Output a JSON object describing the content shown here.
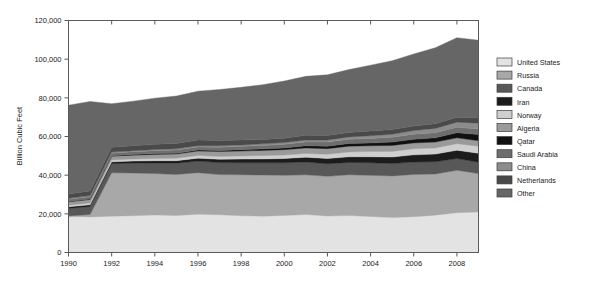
{
  "chart_data": {
    "type": "area",
    "title": "",
    "subtitle": "",
    "xlabel": "",
    "ylabel": "Billion Cubic Feet",
    "xlim": [
      1990,
      2009
    ],
    "ylim": [
      0,
      120000
    ],
    "ytick_step": 20000,
    "xtick_step": 2,
    "grid": false,
    "stacked": true,
    "legend_position": "right",
    "xticks": [
      1990,
      1992,
      1994,
      1996,
      1998,
      2000,
      2002,
      2004,
      2006,
      2008
    ],
    "xtick_labels": [
      "1990",
      "1992",
      "1994",
      "1996",
      "1998",
      "2000",
      "2002",
      "2004",
      "2006",
      "2008"
    ],
    "yticks": [
      0,
      20000,
      40000,
      60000,
      80000,
      100000,
      120000
    ],
    "ytick_labels": [
      "0",
      "20,000",
      "40,000",
      "60,000",
      "80,000",
      "100,000",
      "120,000"
    ],
    "x": [
      1990,
      1991,
      1992,
      1993,
      1994,
      1995,
      1996,
      1997,
      1998,
      1999,
      2000,
      2001,
      2002,
      2003,
      2004,
      2005,
      2006,
      2007,
      2008,
      2009
    ],
    "series": [
      {
        "name": "United States",
        "color": "#e3e3e3",
        "values": [
          18600,
          18400,
          18800,
          19000,
          19400,
          19100,
          19800,
          19500,
          19000,
          18800,
          19200,
          19600,
          18900,
          19100,
          18600,
          18100,
          18500,
          19300,
          20600,
          21000
        ]
      },
      {
        "name": "Russia",
        "color": "#a8a8a8",
        "values": [
          300,
          1200,
          22400,
          22100,
          21400,
          21300,
          21500,
          20800,
          21200,
          21300,
          20700,
          20600,
          20500,
          21100,
          21300,
          21500,
          21900,
          21300,
          21900,
          19800
        ]
      },
      {
        "name": "Canada",
        "color": "#585858",
        "values": [
          3900,
          4200,
          4700,
          5100,
          5500,
          5800,
          6000,
          6200,
          6200,
          6300,
          6500,
          6600,
          6500,
          6400,
          6500,
          6400,
          6400,
          6300,
          6100,
          5900
        ]
      },
      {
        "name": "Iran",
        "color": "#1c1c1c",
        "values": [
          800,
          900,
          1000,
          1100,
          1200,
          1300,
          1500,
          1700,
          1900,
          2000,
          2200,
          2500,
          2700,
          2900,
          3100,
          3400,
          3700,
          4000,
          4300,
          4600
        ]
      },
      {
        "name": "Norway",
        "color": "#cfcfcf",
        "values": [
          900,
          950,
          1000,
          1050,
          1150,
          1250,
          1400,
          1500,
          1600,
          1700,
          1800,
          1900,
          2200,
          2500,
          2700,
          2900,
          3100,
          3200,
          3400,
          3600
        ]
      },
      {
        "name": "Algeria",
        "color": "#9a9a9a",
        "values": [
          1700,
          1800,
          1900,
          2000,
          2100,
          2200,
          2300,
          2500,
          2600,
          2700,
          2800,
          2900,
          2900,
          3000,
          3000,
          3100,
          3100,
          3000,
          3000,
          2900
        ]
      },
      {
        "name": "Qatar",
        "color": "#111111",
        "values": [
          200,
          250,
          300,
          350,
          400,
          450,
          500,
          600,
          700,
          800,
          900,
          1100,
          1300,
          1400,
          1500,
          1700,
          1900,
          2200,
          2700,
          3200
        ]
      },
      {
        "name": "Saudi Arabia",
        "color": "#6e6e6e",
        "values": [
          1100,
          1200,
          1300,
          1400,
          1500,
          1600,
          1600,
          1700,
          1700,
          1800,
          1900,
          2000,
          2100,
          2200,
          2300,
          2500,
          2600,
          2700,
          2800,
          2900
        ]
      },
      {
        "name": "China",
        "color": "#8c8c8c",
        "values": [
          500,
          520,
          540,
          560,
          580,
          620,
          660,
          700,
          750,
          800,
          900,
          1000,
          1100,
          1200,
          1400,
          1600,
          1900,
          2200,
          2600,
          3000
        ]
      },
      {
        "name": "Netherlands",
        "color": "#4a4a4a",
        "values": [
          2300,
          2400,
          2500,
          2600,
          2700,
          2800,
          2900,
          2700,
          2500,
          2300,
          2200,
          2400,
          2300,
          2300,
          2500,
          2400,
          2300,
          2400,
          2600,
          2700
        ]
      },
      {
        "name": "Other",
        "color": "#666666",
        "values": [
          45900,
          46300,
          22500,
          23000,
          23900,
          24500,
          25300,
          26400,
          27300,
          28300,
          29600,
          30500,
          31400,
          32500,
          34000,
          35600,
          37300,
          39300,
          41100,
          40200
        ]
      }
    ]
  },
  "legend": {
    "items": [
      {
        "label": "United States",
        "color": "#e3e3e3"
      },
      {
        "label": "Russia",
        "color": "#a8a8a8"
      },
      {
        "label": "Canada",
        "color": "#585858"
      },
      {
        "label": "Iran",
        "color": "#1c1c1c"
      },
      {
        "label": "Norway",
        "color": "#cfcfcf"
      },
      {
        "label": "Algeria",
        "color": "#9a9a9a"
      },
      {
        "label": "Qatar",
        "color": "#111111"
      },
      {
        "label": "Saudi Arabia",
        "color": "#6e6e6e"
      },
      {
        "label": "China",
        "color": "#8c8c8c"
      },
      {
        "label": "Netherlands",
        "color": "#4a4a4a"
      },
      {
        "label": "Other",
        "color": "#666666"
      }
    ]
  },
  "caption": {
    "text": ""
  }
}
